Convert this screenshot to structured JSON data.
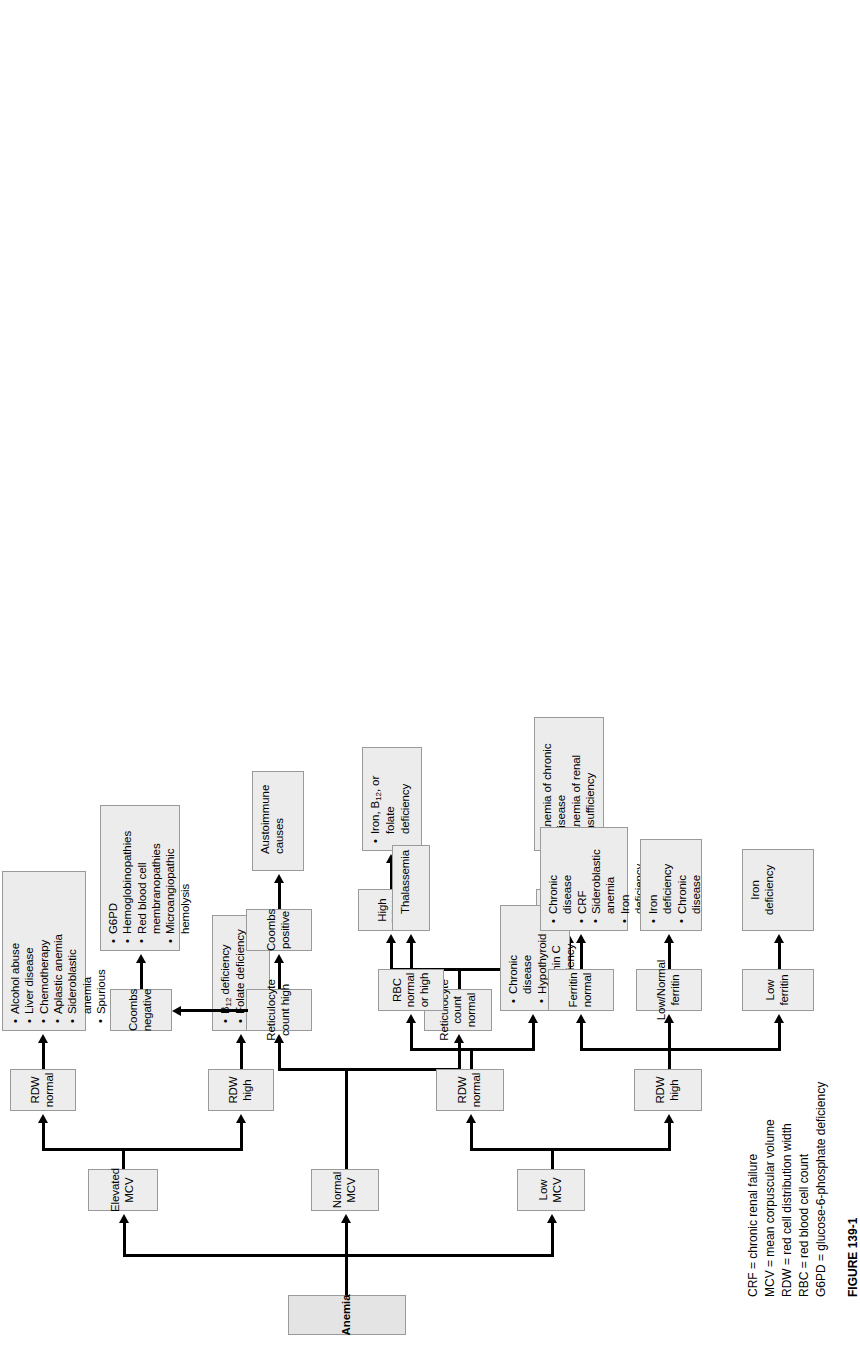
{
  "figure": {
    "root": {
      "label": "Anemia"
    },
    "branches": [
      {
        "id": "low-mcv",
        "label": "Low MCV"
      },
      {
        "id": "normal-mcv",
        "label": "Normal MCV"
      },
      {
        "id": "elevated-mcv",
        "label": "Elevated MCV"
      }
    ],
    "nodes": {
      "rdw_high_low": {
        "label": "RDW high"
      },
      "rdw_normal_low": {
        "label": "RDW normal"
      },
      "low_ferritin": {
        "label": "Low ferritin"
      },
      "low_normal_ferritin": {
        "label": "Low/Normal ferritin"
      },
      "ferritin_normal": {
        "label": "Ferritin normal"
      },
      "rbc_normal_or_high": {
        "label": "RBC normal or high"
      },
      "retic_normal": {
        "label": "Reticulocyte count normal"
      },
      "retic_high": {
        "label": "Reticulocyte count high"
      },
      "rdw_normal_mid": {
        "label": "RDW normal"
      },
      "high_rdw_mid": {
        "label": "High RDW"
      },
      "coombs_positive": {
        "label": "Coombs positive"
      },
      "coombs_negative": {
        "label": "Coombs negative"
      },
      "rdw_high_elev": {
        "label": "RDW high"
      },
      "rdw_normal_elev": {
        "label": "RDW normal"
      }
    },
    "outcomes": {
      "iron_deficiency": {
        "lines": [
          {
            "text": "Iron",
            "bullet": false
          },
          {
            "text": "deficiency",
            "bullet": false
          }
        ]
      },
      "low_normal_ferritin_out": {
        "lines": [
          {
            "text": "Iron",
            "bullet": true
          },
          {
            "text": "deficiency",
            "bullet": false
          },
          {
            "text": "Chronic",
            "bullet": true
          },
          {
            "text": "disease",
            "bullet": false
          }
        ]
      },
      "ferritin_normal_out": {
        "lines": [
          {
            "text": "Chronic",
            "bullet": true
          },
          {
            "text": "disease",
            "bullet": false
          },
          {
            "text": "CRF",
            "bullet": true
          },
          {
            "text": "Sideroblastic",
            "bullet": true
          },
          {
            "text": "anemia",
            "bullet": false
          },
          {
            "text": "Iron",
            "bullet": true
          },
          {
            "text": "deficiency",
            "bullet": false
          }
        ]
      },
      "rdw_normal_low_out": {
        "lines": [
          {
            "text": "Chronic",
            "bullet": true
          },
          {
            "text": "disease",
            "bullet": false
          },
          {
            "text": "Hypothyroid",
            "bullet": true
          },
          {
            "text": "Vitamin C",
            "bullet": true
          },
          {
            "text": "deficiency",
            "bullet": false
          }
        ]
      },
      "thalassemia": {
        "lines": [
          {
            "text": "Thalassemia",
            "bullet": false
          }
        ]
      },
      "rdw_normal_mid_out": {
        "lines": [
          {
            "text": "Anemia of chronic",
            "bullet": true
          },
          {
            "text": "disease",
            "bullet": false
          },
          {
            "text": "Anemia of renal",
            "bullet": true
          },
          {
            "text": "insufficiency",
            "bullet": false
          }
        ]
      },
      "high_rdw_mid_out": {
        "lines": [
          {
            "text": "Iron, B12, or",
            "bullet": true
          },
          {
            "text": "folate",
            "bullet": false
          },
          {
            "text": "deficiency",
            "bullet": false
          }
        ]
      },
      "coombs_positive_out": {
        "lines": [
          {
            "text": "Austoimmune",
            "bullet": false
          },
          {
            "text": "causes",
            "bullet": false
          }
        ]
      },
      "coombs_negative_out": {
        "lines": [
          {
            "text": "G6PD",
            "bullet": true
          },
          {
            "text": "Hemoglobinopathies",
            "bullet": true
          },
          {
            "text": "Red blood cell",
            "bullet": true
          },
          {
            "text": "membranopathies",
            "bullet": false
          },
          {
            "text": "Microangiopathic",
            "bullet": true
          },
          {
            "text": "hemolysis",
            "bullet": false
          }
        ]
      },
      "rdw_high_elev_out": {
        "lines": [
          {
            "text": "B12 deficiency",
            "bullet": true
          },
          {
            "text": "Folate deficiency",
            "bullet": true
          }
        ]
      },
      "rdw_normal_elev_out": {
        "lines": [
          {
            "text": "Alcohol abuse",
            "bullet": true
          },
          {
            "text": "Liver disease",
            "bullet": true
          },
          {
            "text": "Chemotherapy",
            "bullet": true
          },
          {
            "text": "Aplastic anemia",
            "bullet": true
          },
          {
            "text": "Sideroblastic",
            "bullet": true
          },
          {
            "text": "anemia",
            "bullet": false
          },
          {
            "text": "Spurious",
            "bullet": true
          }
        ]
      }
    },
    "legend": [
      "CRF = chronic renal failure",
      "MCV = mean corpuscular volume",
      "RDW = red cell distribution width",
      "RBC = red blood cell count",
      "G6PD = glucose-6-phosphate deficiency"
    ],
    "caption": "FIGURE 139-1",
    "colors": {
      "node_fill": "#ececec",
      "node_border": "#9a9a9a",
      "connector": "#000000"
    }
  }
}
